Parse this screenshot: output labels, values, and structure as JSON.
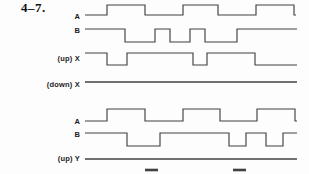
{
  "figure": {
    "problem_number": "4–7.",
    "colors": {
      "line": "#414141",
      "background": "#fdfdfd",
      "text": "#1c1c1c"
    },
    "layout": {
      "width": 309,
      "height": 174,
      "label_right_x": 80,
      "wave_start_x": 85,
      "wave_end_x": 297
    },
    "signals": [
      {
        "id": "a-top",
        "label": "A",
        "y_high": 5,
        "y_low": 15,
        "label_y": 16,
        "initial_level": "low",
        "edge_x": [
          107,
          145,
          183,
          218,
          256,
          294
        ],
        "start_x": 85,
        "end_x": 296
      },
      {
        "id": "b-top",
        "label": "B",
        "y_high": 29,
        "y_low": 42,
        "label_y": 30,
        "initial_level": "high",
        "edge_x": [
          125,
          155,
          170,
          190,
          205,
          237
        ],
        "start_x": 85,
        "end_x": 297
      },
      {
        "id": "up-x",
        "label": "(up) X",
        "y_high": 53,
        "y_low": 65,
        "label_y": 58,
        "initial_level": "high",
        "edge_x": [
          107,
          127,
          193,
          207,
          255
        ],
        "start_x": 85,
        "end_x": 297
      },
      {
        "id": "down-x",
        "label": "(down) X",
        "y_high": 82,
        "y_low": 82,
        "label_y": 84,
        "initial_level": "high",
        "edge_x": [],
        "start_x": 85,
        "end_x": 297
      },
      {
        "id": "a-bottom",
        "label": "A",
        "y_high": 109,
        "y_low": 121,
        "label_y": 121,
        "initial_level": "low",
        "edge_x": [
          107,
          145,
          183,
          220,
          257,
          295
        ],
        "start_x": 85,
        "end_x": 297
      },
      {
        "id": "b-bottom",
        "label": "B",
        "y_high": 133,
        "y_low": 146,
        "label_y": 134,
        "initial_level": "high",
        "edge_x": [
          127,
          160,
          229,
          246,
          266,
          283
        ],
        "start_x": 85,
        "end_x": 297
      },
      {
        "id": "up-y",
        "label": "(up) Y",
        "y_high": 159,
        "y_low": 159,
        "label_y": 158,
        "initial_level": "high",
        "edge_x": [],
        "start_x": 85,
        "end_x": 297
      }
    ],
    "partial_pulse_marks": [
      {
        "x1": 145,
        "x2": 158,
        "y": 170
      },
      {
        "x1": 233,
        "x2": 246,
        "y": 170
      }
    ]
  }
}
